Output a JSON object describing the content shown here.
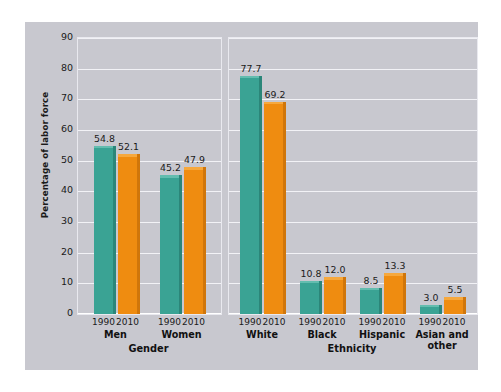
{
  "chart_data": {
    "type": "bar",
    "title": "",
    "xlabel": "",
    "ylabel": "Percentage of labor force",
    "ylim": [
      0,
      90
    ],
    "yticks": [
      90,
      80,
      70,
      60,
      50,
      40,
      30,
      20,
      10,
      0
    ],
    "grid": true,
    "legend": "none",
    "series": [
      {
        "name": "1990",
        "color": "#3aa394"
      },
      {
        "name": "2010",
        "color": "#ef8c10"
      }
    ],
    "groups": [
      {
        "group_title": "Gender",
        "categories": [
          "Men",
          "Women"
        ],
        "bars": [
          {
            "category": "Men",
            "year": "1990",
            "value": 54.8,
            "label": "54.8",
            "series": "1990"
          },
          {
            "category": "Men",
            "year": "2010",
            "value": 52.1,
            "label": "52.1",
            "series": "2010"
          },
          {
            "category": "Women",
            "year": "1990",
            "value": 45.2,
            "label": "45.2",
            "series": "1990"
          },
          {
            "category": "Women",
            "year": "2010",
            "value": 47.9,
            "label": "47.9",
            "series": "2010"
          }
        ]
      },
      {
        "group_title": "Ethnicity",
        "categories": [
          "White",
          "Black",
          "Hispanic",
          "Asian and other"
        ],
        "bars": [
          {
            "category": "White",
            "year": "1990",
            "value": 77.7,
            "label": "77.7",
            "series": "1990"
          },
          {
            "category": "White",
            "year": "2010",
            "value": 69.2,
            "label": "69.2",
            "series": "2010"
          },
          {
            "category": "Black",
            "year": "1990",
            "value": 10.8,
            "label": "10.8",
            "series": "1990"
          },
          {
            "category": "Black",
            "year": "2010",
            "value": 12.0,
            "label": "12.0",
            "series": "2010"
          },
          {
            "category": "Hispanic",
            "year": "1990",
            "value": 8.5,
            "label": "8.5",
            "series": "1990"
          },
          {
            "category": "Hispanic",
            "year": "2010",
            "value": 13.3,
            "label": "13.3",
            "series": "2010"
          },
          {
            "category": "Asian and other",
            "year": "1990",
            "value": 3.0,
            "label": "3.0",
            "series": "1990"
          },
          {
            "category": "Asian and other",
            "year": "2010",
            "value": 5.5,
            "label": "5.5",
            "series": "2010"
          }
        ]
      }
    ]
  },
  "colors": {
    "panel_background": "#c8c8cf",
    "gridline": "#f2f2f6",
    "series_1990": "#3aa394",
    "series_2010": "#ef8c10",
    "text": "#1a1a1a"
  }
}
